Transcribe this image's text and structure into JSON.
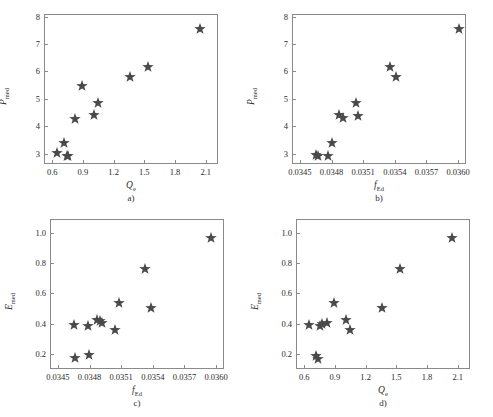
{
  "figure": {
    "marker_color": "#4a4a4a",
    "axis_color": "#8a8a8a",
    "marker_symbol": "star"
  },
  "panels": [
    {
      "id": "a",
      "caption": "a)",
      "xlabel": "Q",
      "xlabel_sub": "e",
      "ylabel": "P",
      "ylabel_sub": "med",
      "xticks": [
        "0.6",
        "0.9",
        "1.2",
        "1.5",
        "1.8",
        "2.1"
      ],
      "xtick_values": [
        0.6,
        0.9,
        1.2,
        1.5,
        1.8,
        2.1
      ],
      "yticks": [
        "3",
        "4",
        "5",
        "6",
        "7",
        "8"
      ],
      "ytick_values": [
        3,
        4,
        5,
        6,
        7,
        8
      ],
      "xlim": [
        0.52,
        2.22
      ],
      "ylim": [
        2.62,
        8.1
      ]
    },
    {
      "id": "b",
      "caption": "b)",
      "xlabel": "f",
      "xlabel_sub": "Ed",
      "ylabel": "P",
      "ylabel_sub": "med",
      "xticks": [
        "0.0345",
        "0.0348",
        "0.0351",
        "0.0354",
        "0.0357",
        "0.0360"
      ],
      "xtick_values": [
        0.0345,
        0.0348,
        0.0351,
        0.0354,
        0.0357,
        0.036
      ],
      "yticks": [
        "3",
        "4",
        "5",
        "6",
        "7",
        "8"
      ],
      "ytick_values": [
        3,
        4,
        5,
        6,
        7,
        8
      ],
      "xlim": [
        0.034425,
        0.036075
      ],
      "ylim": [
        2.62,
        8.1
      ]
    },
    {
      "id": "c",
      "caption": "c)",
      "xlabel": "f",
      "xlabel_sub": "Ed",
      "ylabel": "E",
      "ylabel_sub": "med",
      "xticks": [
        "0.0345",
        "0.0348",
        "0.0351",
        "0.0354",
        "0.0357",
        "0.0360"
      ],
      "xtick_values": [
        0.0345,
        0.0348,
        0.0351,
        0.0354,
        0.0357,
        0.036
      ],
      "yticks": [
        "0.2",
        "0.4",
        "0.6",
        "0.8",
        "1.0"
      ],
      "ytick_values": [
        0.2,
        0.4,
        0.6,
        0.8,
        1.0
      ],
      "xlim": [
        0.034425,
        0.036075
      ],
      "ylim": [
        0.1,
        1.09
      ]
    },
    {
      "id": "d",
      "caption": "d)",
      "xlabel": "Q",
      "xlabel_sub": "e",
      "ylabel": "E",
      "ylabel_sub": "med",
      "xticks": [
        "0.6",
        "0.9",
        "1.2",
        "1.5",
        "1.8",
        "2.1"
      ],
      "xtick_values": [
        0.6,
        0.9,
        1.2,
        1.5,
        1.8,
        2.1
      ],
      "yticks": [
        "0.2",
        "0.4",
        "0.6",
        "0.8",
        "1.0"
      ],
      "ytick_values": [
        0.2,
        0.4,
        0.6,
        0.8,
        1.0
      ],
      "xlim": [
        0.52,
        2.22
      ],
      "ylim": [
        0.1,
        1.09
      ]
    }
  ],
  "chart_data": [
    {
      "type": "scatter",
      "panel": "a",
      "title": "",
      "xlabel": "Q_e",
      "ylabel": "P_med",
      "xlim": [
        0.52,
        2.22
      ],
      "ylim": [
        2.62,
        8.1
      ],
      "grid": false,
      "legend": null,
      "x": [
        0.645,
        0.715,
        0.745,
        0.755,
        0.825,
        0.895,
        1.005,
        1.045,
        1.365,
        1.535,
        2.045
      ],
      "y": [
        3.01,
        3.38,
        2.93,
        2.92,
        4.28,
        5.46,
        4.4,
        4.85,
        5.81,
        6.17,
        7.55
      ]
    },
    {
      "type": "scatter",
      "panel": "b",
      "title": "",
      "xlabel": "f_Ed",
      "ylabel": "P_med",
      "xlim": [
        0.034425,
        0.036075
      ],
      "ylim": [
        2.62,
        8.1
      ],
      "grid": false,
      "legend": null,
      "x": [
        0.034655,
        0.034675,
        0.034765,
        0.034805,
        0.034875,
        0.034905,
        0.035035,
        0.035055,
        0.035355,
        0.035415,
        0.036005
      ],
      "y": [
        2.95,
        2.93,
        2.93,
        3.38,
        4.4,
        4.29,
        4.85,
        4.38,
        6.18,
        5.81,
        7.55
      ]
    },
    {
      "type": "scatter",
      "panel": "c",
      "title": "",
      "xlabel": "f_Ed",
      "ylabel": "E_med",
      "xlim": [
        0.034425,
        0.036075
      ],
      "ylim": [
        0.1,
        1.09
      ],
      "grid": false,
      "legend": null,
      "x": [
        0.034655,
        0.034665,
        0.034785,
        0.034795,
        0.034875,
        0.034895,
        0.034915,
        0.035045,
        0.035075,
        0.035325,
        0.035385,
        0.035955
      ],
      "y": [
        0.39,
        0.17,
        0.385,
        0.19,
        0.425,
        0.415,
        0.405,
        0.355,
        0.535,
        0.76,
        0.5,
        0.965
      ]
    },
    {
      "type": "scatter",
      "panel": "d",
      "title": "",
      "xlabel": "Q_e",
      "ylabel": "E_med",
      "xlim": [
        0.52,
        2.22
      ],
      "ylim": [
        0.1,
        1.09
      ],
      "grid": false,
      "legend": null,
      "x": [
        0.645,
        0.715,
        0.735,
        0.755,
        0.775,
        0.825,
        0.895,
        1.005,
        1.045,
        1.365,
        1.535,
        2.045
      ],
      "y": [
        0.39,
        0.185,
        0.165,
        0.385,
        0.395,
        0.405,
        0.535,
        0.425,
        0.355,
        0.5,
        0.76,
        0.965
      ]
    }
  ]
}
